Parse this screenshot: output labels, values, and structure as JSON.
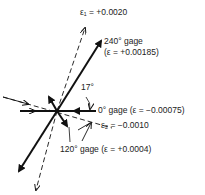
{
  "diagram": {
    "labels": {
      "eps1": "ε₁ = +0.0020",
      "gage240_line1": "240° gage",
      "gage240_line2": "(ε = +0.00185)",
      "angle": "17°",
      "gage0": "0° gage (ε = −0.00075)",
      "eps2": "ε₂ = −0.0010",
      "gage120": "120° gage (ε = +0.0004)"
    },
    "values": {
      "eps1": 0.002,
      "eps2": -0.001,
      "gage0": -0.00075,
      "gage120": 0.0004,
      "gage240": 0.00185,
      "angle_deg": 17
    },
    "colors": {
      "line": "#111111",
      "text": "#222222",
      "background": "#ffffff"
    }
  }
}
